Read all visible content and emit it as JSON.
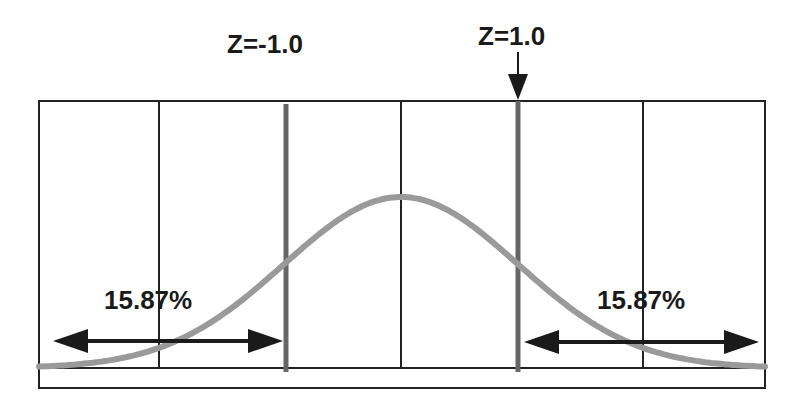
{
  "diagram": {
    "title": "",
    "z_labels": [
      {
        "text": "Z=-1.0",
        "x": 285
      },
      {
        "text": "Z=1.0",
        "x": 518
      }
    ],
    "tail_labels": {
      "left": "15.87%",
      "right": "15.87%"
    },
    "colors": {
      "frame": "#222222",
      "curve": "#999999",
      "z_lines": "#666666",
      "arrows": "#1a1a1a",
      "text": "#1a1a1a"
    }
  },
  "chart_data": {
    "type": "line",
    "x_range": [
      -3,
      3
    ],
    "grid_x": [
      -2,
      -1,
      0,
      1,
      2
    ],
    "markers": [
      {
        "z": -1.0,
        "label": "Z=-1.0"
      },
      {
        "z": 1.0,
        "label": "Z=1.0",
        "arrow": true
      }
    ],
    "tail_areas": [
      {
        "side": "left",
        "region": "Z < -1.0",
        "percent": 15.87,
        "label": "15.87%"
      },
      {
        "side": "right",
        "region": "Z > 1.0",
        "percent": 15.87,
        "label": "15.87%"
      }
    ],
    "xlabel": "",
    "ylabel": ""
  }
}
